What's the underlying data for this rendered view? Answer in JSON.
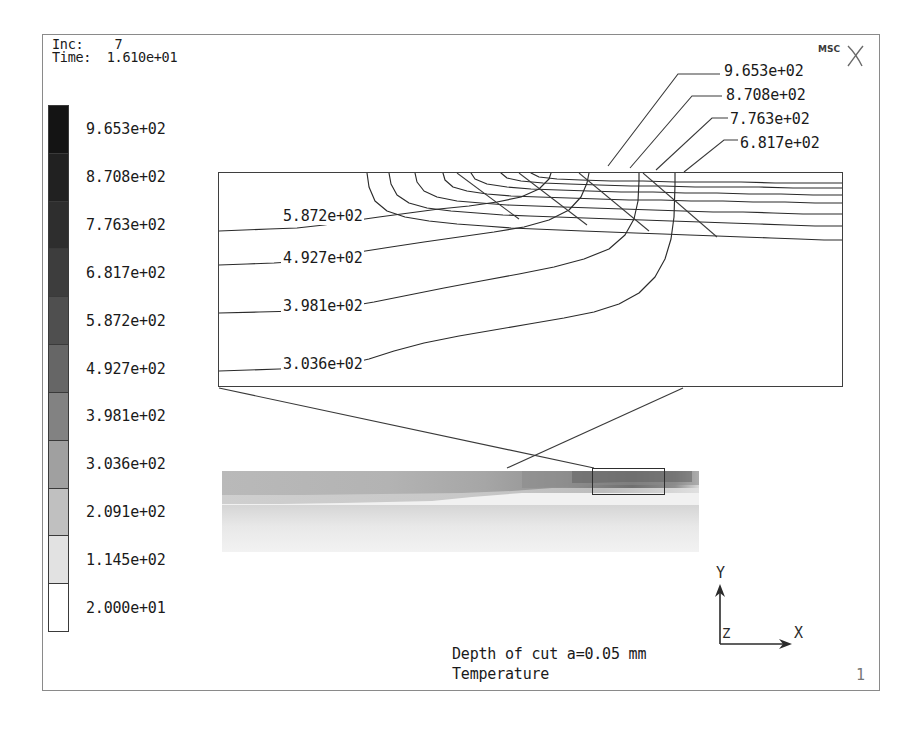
{
  "header": {
    "inc_label": "Inc:",
    "inc_value": "7",
    "time_label": "Time:",
    "time_value": "1.610e+01",
    "inc_line": "Inc:    7",
    "time_line": "Time:  1.610e+01"
  },
  "logo": {
    "text": "MSC",
    "mark": "x-mark-icon"
  },
  "colorbar": {
    "title": "Temperature",
    "labels": [
      "9.653e+02",
      "8.708e+02",
      "7.763e+02",
      "6.817e+02",
      "5.872e+02",
      "4.927e+02",
      "3.981e+02",
      "3.036e+02",
      "2.091e+02",
      "1.145e+02",
      "2.000e+01"
    ],
    "values": [
      965.3,
      870.8,
      776.3,
      681.7,
      587.2,
      492.7,
      398.1,
      303.6,
      209.1,
      114.5,
      20.0
    ],
    "band_colors": [
      "#141414",
      "#212121",
      "#2e2e2e",
      "#3d3d3d",
      "#4f4f4f",
      "#666666",
      "#828282",
      "#a0a0a0",
      "#c0c0c0",
      "#e2e2e2",
      "#ffffff"
    ]
  },
  "callouts": [
    {
      "label": "9.653e+02",
      "value": 965.3
    },
    {
      "label": "8.708e+02",
      "value": 870.8
    },
    {
      "label": "7.763e+02",
      "value": 776.3
    },
    {
      "label": "6.817e+02",
      "value": 681.7
    }
  ],
  "inline_labels": [
    {
      "label": "5.872e+02",
      "value": 587.2
    },
    {
      "label": "4.927e+02",
      "value": 492.7
    },
    {
      "label": "3.981e+02",
      "value": 398.1
    },
    {
      "label": "3.036e+02",
      "value": 303.6
    }
  ],
  "triad": {
    "x": "X",
    "y": "Y",
    "z": "Z"
  },
  "captions": {
    "line1": "Depth of cut a=0.05 mm",
    "line2": "Temperature",
    "page": "1"
  },
  "chart_data": {
    "type": "contour",
    "title": "Temperature",
    "subtitle": "Depth of cut a=0.05 mm",
    "quantity": "Temperature",
    "increment": 7,
    "time": 16.1,
    "units_note": "contour values in degrees, exponential notation",
    "contour_levels": [
      20.0,
      114.5,
      209.1,
      303.6,
      398.1,
      492.7,
      587.2,
      681.7,
      776.3,
      870.8,
      965.3
    ],
    "contour_level_labels": [
      "2.000e+01",
      "1.145e+02",
      "2.091e+02",
      "3.036e+02",
      "3.981e+02",
      "4.927e+02",
      "5.872e+02",
      "6.817e+02",
      "7.763e+02",
      "8.708e+02",
      "9.653e+02"
    ],
    "min": 20.0,
    "max": 965.3,
    "labeled_in_detail": [
      587.2,
      492.7,
      398.1,
      303.6
    ],
    "labeled_by_leader": [
      965.3,
      870.8,
      776.3,
      681.7
    ],
    "colormap": "grayscale-inverted",
    "legend_position": "left",
    "hot_spot_location": "upper-right corner of detail region"
  }
}
